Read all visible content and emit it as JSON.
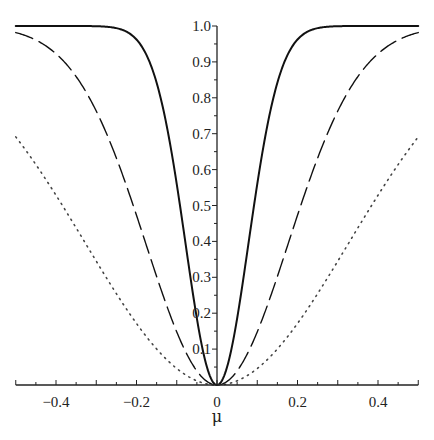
{
  "chart_data": {
    "type": "line",
    "title": "",
    "xlabel": "μ",
    "ylabel": "",
    "xlim": [
      -0.5,
      0.5
    ],
    "ylim": [
      0,
      1.0
    ],
    "grid": false,
    "legend": null,
    "x_ticks": [
      "-0.4",
      "-0.2",
      "0",
      "0.2",
      "0.4"
    ],
    "y_ticks": [
      "0.1",
      "0.2",
      "0.3",
      "0.4",
      "0.5",
      "0.6",
      "0.7",
      "0.8",
      "0.9",
      "1.0"
    ],
    "series": [
      {
        "name": "solid",
        "style": "solid",
        "formula": "1 - exp(-82*mu^2)",
        "x": [
          -0.5,
          -0.3,
          -0.2,
          -0.15,
          -0.1,
          -0.05,
          0,
          0.05,
          0.1,
          0.15,
          0.2,
          0.3,
          0.5
        ],
        "values": [
          1.0,
          1.0,
          0.96,
          0.84,
          0.56,
          0.19,
          0,
          0.19,
          0.56,
          0.84,
          0.96,
          1.0,
          1.0
        ]
      },
      {
        "name": "dashed",
        "style": "dashed",
        "formula": "1 - exp(-16*mu^2)",
        "x": [
          -0.5,
          -0.4,
          -0.3,
          -0.2,
          -0.1,
          0,
          0.1,
          0.2,
          0.3,
          0.4,
          0.5
        ],
        "values": [
          0.98,
          0.92,
          0.76,
          0.47,
          0.15,
          0,
          0.15,
          0.47,
          0.76,
          0.92,
          0.98
        ]
      },
      {
        "name": "dotted",
        "style": "dotted",
        "formula": "1 - exp(-4.7*mu^2)",
        "x": [
          -0.5,
          -0.4,
          -0.3,
          -0.2,
          -0.1,
          0,
          0.1,
          0.2,
          0.3,
          0.4,
          0.5
        ],
        "values": [
          0.69,
          0.53,
          0.34,
          0.17,
          0.05,
          0,
          0.05,
          0.17,
          0.34,
          0.53,
          0.69
        ]
      }
    ]
  }
}
